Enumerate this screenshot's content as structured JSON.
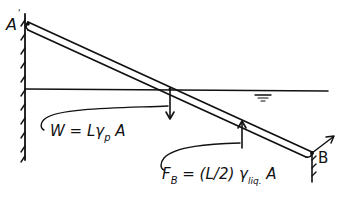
{
  "diagram": {
    "type": "free-body-diagram",
    "labels": {
      "point_a": "A",
      "point_b": "B",
      "weight_label": "W = Lγ",
      "weight_subscript": "p",
      "weight_tail": " A",
      "buoyancy_label_f": "F",
      "buoyancy_subscript_b": "B",
      "buoyancy_eq": " = (L/2) γ",
      "buoyancy_subscript_liq": "liq.",
      "buoyancy_tail": " A"
    },
    "elements": [
      {
        "name": "wall-left",
        "kind": "hatched-support"
      },
      {
        "name": "rod",
        "kind": "slanted-beam",
        "from": "A",
        "to": "B"
      },
      {
        "name": "water-surface",
        "kind": "free-surface-line",
        "symbol": "▽"
      },
      {
        "name": "weight-arrow",
        "kind": "force",
        "direction": "down"
      },
      {
        "name": "buoyancy-arrow",
        "kind": "force",
        "direction": "up"
      },
      {
        "name": "support-b",
        "kind": "hatched-support"
      },
      {
        "name": "reaction-b",
        "kind": "force",
        "direction": "up-right"
      }
    ]
  }
}
